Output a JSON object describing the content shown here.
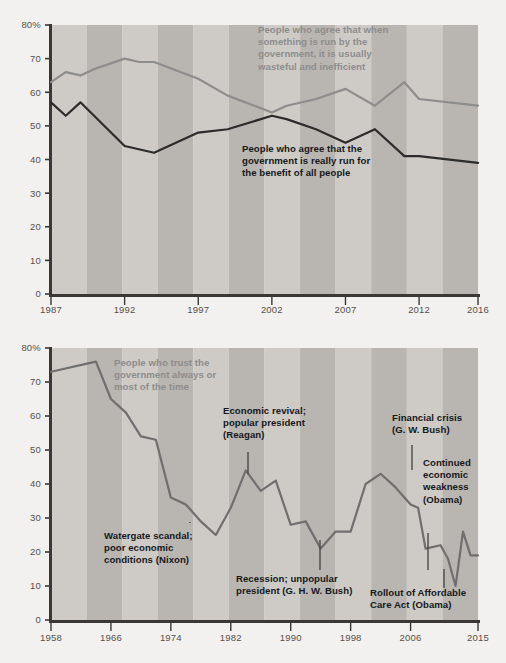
{
  "chart_data": [
    {
      "id": "top",
      "type": "line",
      "title": "",
      "xlabel": "",
      "ylabel": "",
      "xlim": [
        1987,
        2016
      ],
      "ylim": [
        0,
        80
      ],
      "yticks": [
        0,
        10,
        20,
        30,
        40,
        50,
        60,
        70,
        80
      ],
      "ytick_labels": [
        "0",
        "10",
        "20",
        "30",
        "40",
        "50",
        "60",
        "70",
        "80%"
      ],
      "xticks": [
        1987,
        1992,
        1997,
        2002,
        2007,
        2012,
        2016
      ],
      "xtick_labels": [
        "1987",
        "1992",
        "1997",
        "2002",
        "2007",
        "2012",
        "2016"
      ],
      "grid": false,
      "legend_position": "inline-annotation",
      "banded_background": true,
      "series": [
        {
          "name": "People who agree that when something is run by the government, it is usually wasteful and inefficient",
          "color": "#8d8d8d",
          "x": [
            1987,
            1988,
            1989,
            1990,
            1992,
            1993,
            1994,
            1997,
            1999,
            2002,
            2003,
            2005,
            2007,
            2009,
            2011,
            2012,
            2016
          ],
          "values": [
            63,
            66,
            65,
            67,
            70,
            69,
            69,
            64,
            59,
            54,
            56,
            58,
            61,
            56,
            63,
            58,
            56
          ]
        },
        {
          "name": "People who agree that the government is really run for the benefit of all people",
          "color": "#2c2c2c",
          "x": [
            1987,
            1988,
            1989,
            1992,
            1994,
            1997,
            1999,
            2002,
            2003,
            2005,
            2007,
            2009,
            2011,
            2012,
            2016
          ],
          "values": [
            57,
            53,
            57,
            44,
            42,
            48,
            49,
            53,
            52,
            49,
            45,
            49,
            41,
            41,
            39
          ]
        }
      ],
      "annotations": [
        {
          "name": "wasteful-inefficient-label",
          "lines": [
            "People who agree that when",
            "something is run by the",
            "government, it is usually",
            "wasteful and inefficient"
          ],
          "color": "#8d8d8d",
          "x": 258,
          "y": 33
        },
        {
          "name": "benefit-of-all-label",
          "lines": [
            "People who agree that the",
            "government is really run for",
            "the benefit of all people"
          ],
          "color": "#16181c",
          "x": 242,
          "y": 152
        }
      ]
    },
    {
      "id": "bottom",
      "type": "line",
      "title": "",
      "xlabel": "",
      "ylabel": "",
      "xlim": [
        1958,
        2015
      ],
      "ylim": [
        0,
        80
      ],
      "yticks": [
        0,
        10,
        20,
        30,
        40,
        50,
        60,
        70,
        80
      ],
      "ytick_labels": [
        "0",
        "10",
        "20",
        "30",
        "40",
        "50",
        "60",
        "70",
        "80%"
      ],
      "xticks": [
        1958,
        1966,
        1974,
        1982,
        1990,
        1998,
        2006,
        2015
      ],
      "xtick_labels": [
        "1958",
        "1966",
        "1974",
        "1982",
        "1990",
        "1998",
        "2006",
        "2015"
      ],
      "grid": false,
      "legend_position": "inline-annotation",
      "banded_background": true,
      "series": [
        {
          "name": "People who trust the government always or most of the time",
          "color": "#6f6f6f",
          "x": [
            1958,
            1964,
            1966,
            1968,
            1970,
            1972,
            1974,
            1976,
            1978,
            1980,
            1982,
            1984,
            1986,
            1988,
            1990,
            1992,
            1994,
            1996,
            1998,
            2000,
            2002,
            2004,
            2006,
            2007,
            2008,
            2010,
            2011,
            2012,
            2013,
            2014,
            2015
          ],
          "values": [
            73,
            76,
            65,
            61,
            54,
            53,
            36,
            34,
            29,
            25,
            33,
            44,
            38,
            41,
            28,
            29,
            21,
            26,
            26,
            40,
            43,
            39,
            34,
            33,
            21,
            22,
            18,
            10,
            26,
            19,
            19
          ]
        }
      ],
      "annotations": [
        {
          "name": "trust-government-label",
          "lines": [
            "People who trust the",
            "government always or",
            "most of the time"
          ],
          "color": "#8d8d8d",
          "x": 114,
          "y": 366,
          "leader": null
        },
        {
          "name": "watergate-label",
          "lines": [
            "Watergate scandal;",
            "poor economic",
            "conditions (Nixon)"
          ],
          "color": "#16181c",
          "x": 104,
          "y": 539,
          "leader": {
            "x1": 190,
            "y1": 522,
            "x2": 190,
            "y2": 523
          }
        },
        {
          "name": "reagan-label",
          "lines": [
            "Economic revival;",
            "popular president",
            "(Reagan)"
          ],
          "color": "#16181c",
          "x": 223,
          "y": 414,
          "leader": {
            "x1": 248,
            "y1": 452,
            "x2": 248,
            "y2": 474
          }
        },
        {
          "name": "recession-ghw-bush-label",
          "lines": [
            "Recession; unpopular",
            "president (G. H. W. Bush)"
          ],
          "color": "#16181c",
          "x": 236,
          "y": 582,
          "leader": {
            "x1": 320,
            "y1": 540,
            "x2": 320,
            "y2": 570
          }
        },
        {
          "name": "financial-crisis-label",
          "lines": [
            "Financial crisis",
            "(G. W. Bush)"
          ],
          "color": "#16181c",
          "x": 392,
          "y": 421,
          "leader": {
            "x1": 412,
            "y1": 445,
            "x2": 412,
            "y2": 470
          }
        },
        {
          "name": "continued-weakness-label",
          "lines": [
            "Continued",
            "economic",
            "weakness",
            "(Obama)"
          ],
          "color": "#16181c",
          "x": 423,
          "y": 466,
          "leader": {
            "x1": 428,
            "y1": 533,
            "x2": 428,
            "y2": 570
          }
        },
        {
          "name": "affordable-care-act-label",
          "lines": [
            "Rollout of Affordable",
            "Care Act (Obama)"
          ],
          "color": "#16181c",
          "x": 370,
          "y": 596,
          "leader": {
            "x1": 444,
            "y1": 569,
            "x2": 444,
            "y2": 588
          }
        }
      ]
    }
  ],
  "style": {
    "background": "#f2f1ef",
    "band_light": "#cecbc6",
    "band_dark": "#b9b5b0",
    "axis_color": "#3a3835",
    "tick_text": "#55504b"
  },
  "geometry": {
    "top": {
      "plot_x0": 51,
      "plot_x1": 478,
      "plot_y0": 25,
      "plot_y1": 294,
      "x_axis_label_y": 313
    },
    "bottom": {
      "plot_x0": 51,
      "plot_x1": 478,
      "plot_y0": 348,
      "plot_y1": 620,
      "x_axis_label_y": 641
    }
  }
}
